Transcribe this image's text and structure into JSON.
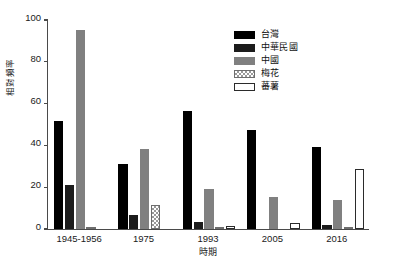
{
  "chart_data": {
    "type": "bar",
    "title": "",
    "xlabel": "時期",
    "ylabel": "相對頻率",
    "categories": [
      "1945-1956",
      "1975",
      "1993",
      "2005",
      "2016"
    ],
    "ylim": [
      0,
      100
    ],
    "yticks": [
      0,
      20,
      40,
      60,
      80,
      100
    ],
    "grid": false,
    "legend_position": "top-right",
    "series": [
      {
        "name": "台灣",
        "color": "#000000",
        "pattern": "solid",
        "values": [
          51.8,
          31.2,
          56.5,
          47.6,
          39.2
        ]
      },
      {
        "name": "中華民國",
        "color": "#1c1c1c",
        "pattern": "solid",
        "values": [
          21.0,
          6.8,
          3.3,
          0.0,
          2.0
        ]
      },
      {
        "name": "中國",
        "color": "#808080",
        "pattern": "solid",
        "values": [
          95.0,
          38.4,
          19.0,
          15.5,
          14.0
        ]
      },
      {
        "name": "梅花",
        "color": "#ffffff",
        "pattern": "checker",
        "values": [
          0.7,
          11.6,
          1.0,
          0.0,
          1.0
        ]
      },
      {
        "name": "蕃薯",
        "color": "#ffffff",
        "pattern": "open",
        "values": [
          0.0,
          0.0,
          1.5,
          2.9,
          28.6
        ]
      }
    ]
  },
  "axes": {
    "ytick_labels": [
      "0",
      "20",
      "40",
      "60",
      "80",
      "100"
    ],
    "xtick_labels": [
      "1945-1956",
      "1975",
      "1993",
      "2005",
      "2016"
    ]
  },
  "legend": {
    "items": [
      {
        "label": "台灣"
      },
      {
        "label": "中華民國"
      },
      {
        "label": "中國"
      },
      {
        "label": "梅花"
      },
      {
        "label": "蕃薯"
      }
    ]
  }
}
